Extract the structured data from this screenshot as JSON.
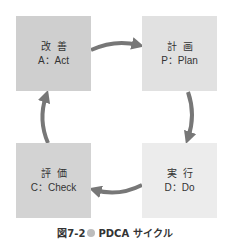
{
  "diagram": {
    "type": "cycle",
    "direction": "clockwise",
    "nodes": [
      {
        "id": "act",
        "jp": "改善",
        "en": "A：Act",
        "position": "top-left",
        "color": "#cfcfcf"
      },
      {
        "id": "plan",
        "jp": "計画",
        "en": "P：Plan",
        "position": "top-right",
        "color": "#e1e1e1"
      },
      {
        "id": "do",
        "jp": "実行",
        "en": "D：Do",
        "position": "bottom-right",
        "color": "#ececec"
      },
      {
        "id": "check",
        "jp": "評価",
        "en": "C：Check",
        "position": "bottom-left",
        "color": "#d3d3d3"
      }
    ],
    "edges": [
      {
        "from": "act",
        "to": "plan"
      },
      {
        "from": "plan",
        "to": "do"
      },
      {
        "from": "do",
        "to": "check"
      },
      {
        "from": "check",
        "to": "act"
      }
    ],
    "arrow_color": "#777777"
  },
  "caption": {
    "figure_number": "図7-2",
    "bullet_color": "#bdbdbd",
    "title": "PDCA サイクル"
  }
}
